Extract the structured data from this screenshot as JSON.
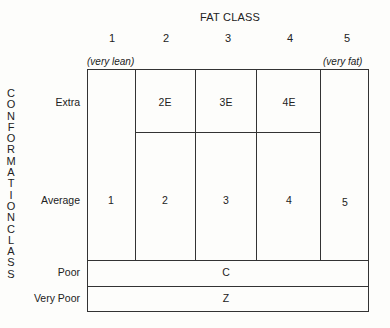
{
  "diagram": {
    "title": "FAT CLASS",
    "columns": [
      {
        "number": "1",
        "note": "(very lean)"
      },
      {
        "number": "2",
        "note": ""
      },
      {
        "number": "3",
        "note": ""
      },
      {
        "number": "4",
        "note": ""
      },
      {
        "number": "5",
        "note": "(very fat)"
      }
    ],
    "vertical_axis_title": "CONFORMATION CLASS",
    "vertical_letters": [
      "C",
      "O",
      "N",
      "F",
      "O",
      "R",
      "M",
      "A",
      "T",
      "I",
      "O",
      "N",
      "C",
      "L",
      "A",
      "S",
      "S"
    ],
    "rows": {
      "extra": "Extra",
      "average": "Average",
      "poor": "Poor",
      "very_poor": "Very Poor"
    },
    "cells": {
      "extra_2": "2E",
      "extra_3": "3E",
      "extra_4": "4E",
      "col_1": "1",
      "avg_2": "2",
      "avg_3": "3",
      "avg_4": "4",
      "col_5": "5",
      "poor": "C",
      "very_poor": "Z"
    }
  }
}
